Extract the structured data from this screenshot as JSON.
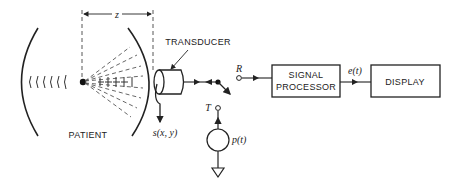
{
  "diagram": {
    "type": "block-diagram",
    "labels": {
      "patient": "PATIENT",
      "transducer": "TRANSDUCER",
      "signal_processor_line1": "SIGNAL",
      "signal_processor_line2": "PROCESSOR",
      "display": "DISPLAY",
      "distance": "z",
      "receive_terminal": "R",
      "transmit_terminal": "T",
      "surface_signal": "s(x, y)",
      "pulse_source": "p(t)",
      "processor_output": "e(t)"
    },
    "nodes": [
      {
        "id": "patient",
        "label": "PATIENT"
      },
      {
        "id": "transducer",
        "label": "TRANSDUCER"
      },
      {
        "id": "switch",
        "label": "T/R switch"
      },
      {
        "id": "pulse_source",
        "label": "p(t)"
      },
      {
        "id": "signal_processor",
        "label": "SIGNAL PROCESSOR"
      },
      {
        "id": "display",
        "label": "DISPLAY"
      }
    ],
    "edges": [
      {
        "from": "transducer",
        "to": "switch"
      },
      {
        "from": "switch",
        "to": "signal_processor",
        "via": "R"
      },
      {
        "from": "pulse_source",
        "to": "switch",
        "via": "T"
      },
      {
        "from": "signal_processor",
        "to": "display",
        "label": "e(t)"
      }
    ],
    "colors": {
      "stroke": "#222222",
      "background": "#ffffff"
    }
  }
}
